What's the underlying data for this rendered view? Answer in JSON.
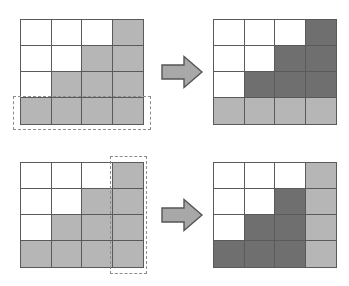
{
  "figure": {
    "grid_size": {
      "rows": 4,
      "cols": 4
    },
    "colors": {
      "empty": "#ffffff",
      "light_gray": "#b6b6b6",
      "dark_gray": "#6f6f6f",
      "grid_line": "#5a5a5a",
      "selection_dash": "#8c8c8c",
      "arrow_fill": "#a8a8a8",
      "arrow_outline": "#555555",
      "background": "#ffffff"
    },
    "legend": {
      "empty_label": "empty",
      "light_label": "light gray",
      "dark_label": "dark gray"
    },
    "arrow": {
      "icon": "right-arrow-icon",
      "direction": "right",
      "label": "transforms to"
    },
    "rows": [
      {
        "id": "row-selection-example",
        "selection": {
          "orientation": "row",
          "index": 3,
          "label": "bottom row selected",
          "style": "dashed"
        },
        "before": {
          "label": "before",
          "cells": [
            [
              "empty",
              "empty",
              "empty",
              "light"
            ],
            [
              "empty",
              "empty",
              "light",
              "light"
            ],
            [
              "empty",
              "light",
              "light",
              "light"
            ],
            [
              "light",
              "light",
              "light",
              "light"
            ]
          ]
        },
        "after": {
          "label": "after",
          "cells": [
            [
              "empty",
              "empty",
              "empty",
              "dark"
            ],
            [
              "empty",
              "empty",
              "dark",
              "dark"
            ],
            [
              "empty",
              "dark",
              "dark",
              "dark"
            ],
            [
              "light",
              "light",
              "light",
              "light"
            ]
          ]
        }
      },
      {
        "id": "column-selection-example",
        "selection": {
          "orientation": "column",
          "index": 3,
          "label": "rightmost column selected",
          "style": "dashed"
        },
        "before": {
          "label": "before",
          "cells": [
            [
              "empty",
              "empty",
              "empty",
              "light"
            ],
            [
              "empty",
              "empty",
              "light",
              "light"
            ],
            [
              "empty",
              "light",
              "light",
              "light"
            ],
            [
              "light",
              "light",
              "light",
              "light"
            ]
          ]
        },
        "after": {
          "label": "after",
          "cells": [
            [
              "empty",
              "empty",
              "empty",
              "light"
            ],
            [
              "empty",
              "empty",
              "dark",
              "light"
            ],
            [
              "empty",
              "dark",
              "dark",
              "light"
            ],
            [
              "dark",
              "dark",
              "dark",
              "light"
            ]
          ]
        }
      }
    ]
  }
}
